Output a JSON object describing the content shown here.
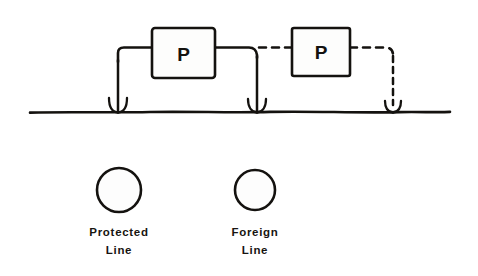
{
  "figure": {
    "kind": "cathodic-protection-schematic",
    "background_color": "#ffffff",
    "ink_color": "#14120f",
    "width": 478,
    "height": 276
  },
  "units": [
    {
      "id": "protected-rectifier",
      "label": "P",
      "x": 152,
      "y": 28,
      "width": 63,
      "height": 50,
      "line_style": "solid"
    },
    {
      "id": "foreign-rectifier",
      "label": "P",
      "x": 292,
      "y": 28,
      "width": 58,
      "height": 48,
      "line_style": "dashed"
    }
  ],
  "ground": {
    "name": "earth-line",
    "x_start": 30,
    "x_end": 450,
    "y": 112,
    "anchors": [
      {
        "id": "anchor-left",
        "x": 118,
        "style": "solid"
      },
      {
        "id": "anchor-middle",
        "x": 257,
        "style": "solid"
      },
      {
        "id": "anchor-right",
        "x": 393,
        "style": "dashed"
      }
    ]
  },
  "wires": {
    "protected_style": "solid",
    "foreign_style": "dashed",
    "bus_y": 48
  },
  "legend": {
    "items": [
      {
        "id": "legend-protected",
        "symbol": "circle-open",
        "cx": 119,
        "cy": 190,
        "r": 22,
        "label_line1": "Protected",
        "label_line2": "Line"
      },
      {
        "id": "legend-foreign",
        "symbol": "circle-open",
        "cx": 255,
        "cy": 190,
        "r": 20,
        "label_line1": "Foreign",
        "label_line2": "Line"
      }
    ]
  }
}
